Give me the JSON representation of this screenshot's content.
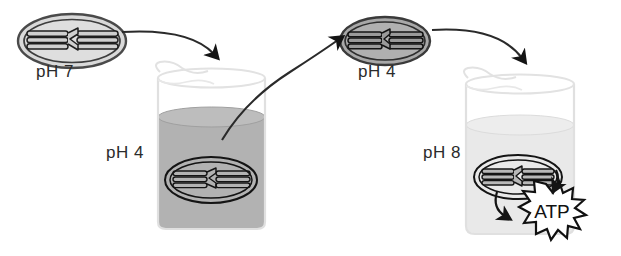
{
  "diagram": {
    "type": "process-diagram",
    "stages": [
      {
        "id": "chloroplast-ph7",
        "label": "pH 7",
        "description": "Isolated chloroplast at neutral pH",
        "fill": "#d9d9d9"
      },
      {
        "id": "beaker-ph4",
        "label": "pH 4",
        "description": "Chloroplast incubated in acidic pH 4 bath",
        "liquid_color": "#b2b2b2"
      },
      {
        "id": "chloroplast-ph4",
        "label": "pH 4",
        "description": "Chloroplast equilibrated to pH 4 interior",
        "fill": "#a8a8a8"
      },
      {
        "id": "beaker-ph8",
        "label": "pH 8",
        "description": "Chloroplast transferred to pH 8 buffer, ATP produced",
        "liquid_color": "#e9e9e9"
      }
    ],
    "product": {
      "label": "ATP",
      "shape": "starburst"
    },
    "colors": {
      "ink": "#2b2b2b",
      "arrow": "#1a1a1a",
      "glass": "#e3e3e3",
      "liquid_dark": "#b2b2b2",
      "liquid_light": "#e9e9e9",
      "chloroplast_light": "#d9d9d9",
      "chloroplast_dark": "#a8a8a8",
      "burst_fill": "#ffffff",
      "burst_stroke": "#111111"
    },
    "arrows": [
      {
        "id": "arrow-1",
        "from": "chloroplast-ph7",
        "to": "beaker-ph4"
      },
      {
        "id": "arrow-2",
        "from": "beaker-ph4",
        "to": "chloroplast-ph4"
      },
      {
        "id": "arrow-3",
        "from": "chloroplast-ph4",
        "to": "beaker-ph8"
      },
      {
        "id": "arrow-atp-left",
        "from": "chloroplast-ph8",
        "to": "atp-burst"
      },
      {
        "id": "arrow-atp-right",
        "from": "chloroplast-ph8",
        "to": "atp-burst"
      }
    ]
  }
}
